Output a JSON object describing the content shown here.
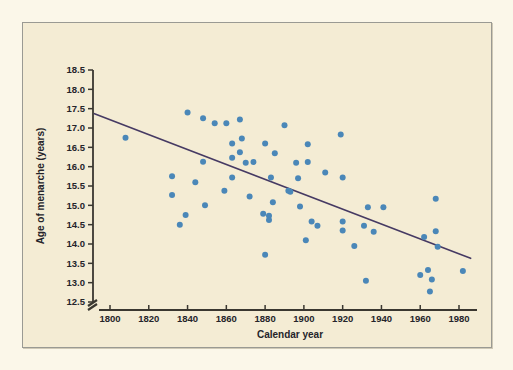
{
  "figure": {
    "background_color": "#f4ecd4",
    "page_color": "#fbf7e9",
    "frame_color": "#9a9a93"
  },
  "chart_data": {
    "type": "scatter",
    "title": "",
    "xlabel": "Calendar year",
    "ylabel": "Age of menarche (years)",
    "xlim": [
      1785,
      1990
    ],
    "ylim": [
      12.5,
      18.5
    ],
    "x_ticks": [
      1800,
      1820,
      1840,
      1860,
      1880,
      1900,
      1920,
      1940,
      1960,
      1980
    ],
    "y_ticks": [
      12.5,
      13.0,
      13.5,
      14.0,
      14.5,
      15.0,
      15.5,
      16.0,
      16.5,
      17.0,
      17.5,
      18.0,
      18.5
    ],
    "x_tick_labels": [
      "1800",
      "1820",
      "1840",
      "1860",
      "1880",
      "1900",
      "1920",
      "1940",
      "1960",
      "1980"
    ],
    "y_tick_labels": [
      "12.5",
      "13.0",
      "13.5",
      "14.0",
      "14.5",
      "15.0",
      "15.5",
      "16.0",
      "16.5",
      "17.0",
      "17.5",
      "18.0",
      "18.5"
    ],
    "grid": false,
    "legend": null,
    "axis_break_y": true,
    "point_color": "#4a87b8",
    "point_radius": 3.0,
    "trendline": {
      "color": "#463a63",
      "width": 1.6,
      "x_start": 1792,
      "y_start": 17.37,
      "x_end": 1986,
      "y_end": 13.63
    },
    "points": [
      {
        "x": 1808,
        "y": 16.75
      },
      {
        "x": 1832,
        "y": 15.75
      },
      {
        "x": 1832,
        "y": 15.27
      },
      {
        "x": 1836,
        "y": 14.5
      },
      {
        "x": 1839,
        "y": 14.75
      },
      {
        "x": 1840,
        "y": 17.4
      },
      {
        "x": 1844,
        "y": 15.6
      },
      {
        "x": 1848,
        "y": 17.25
      },
      {
        "x": 1848,
        "y": 16.13
      },
      {
        "x": 1849,
        "y": 15.0
      },
      {
        "x": 1854,
        "y": 17.12
      },
      {
        "x": 1859,
        "y": 15.38
      },
      {
        "x": 1860,
        "y": 17.12
      },
      {
        "x": 1863,
        "y": 16.6
      },
      {
        "x": 1863,
        "y": 16.23
      },
      {
        "x": 1863,
        "y": 15.72
      },
      {
        "x": 1867,
        "y": 17.22
      },
      {
        "x": 1867,
        "y": 16.37
      },
      {
        "x": 1868,
        "y": 16.73
      },
      {
        "x": 1870,
        "y": 16.1
      },
      {
        "x": 1872,
        "y": 15.23
      },
      {
        "x": 1874,
        "y": 16.12
      },
      {
        "x": 1879,
        "y": 14.78
      },
      {
        "x": 1880,
        "y": 16.6
      },
      {
        "x": 1880,
        "y": 13.72
      },
      {
        "x": 1882,
        "y": 14.73
      },
      {
        "x": 1882,
        "y": 14.62
      },
      {
        "x": 1883,
        "y": 15.72
      },
      {
        "x": 1884,
        "y": 15.08
      },
      {
        "x": 1885,
        "y": 16.35
      },
      {
        "x": 1890,
        "y": 17.07
      },
      {
        "x": 1892,
        "y": 15.38
      },
      {
        "x": 1893,
        "y": 15.35
      },
      {
        "x": 1896,
        "y": 16.1
      },
      {
        "x": 1897,
        "y": 15.7
      },
      {
        "x": 1898,
        "y": 14.97
      },
      {
        "x": 1901,
        "y": 14.1
      },
      {
        "x": 1902,
        "y": 16.58
      },
      {
        "x": 1902,
        "y": 16.12
      },
      {
        "x": 1904,
        "y": 14.58
      },
      {
        "x": 1907,
        "y": 14.47
      },
      {
        "x": 1911,
        "y": 15.85
      },
      {
        "x": 1919,
        "y": 16.83
      },
      {
        "x": 1920,
        "y": 15.72
      },
      {
        "x": 1920,
        "y": 14.58
      },
      {
        "x": 1920,
        "y": 14.35
      },
      {
        "x": 1926,
        "y": 13.95
      },
      {
        "x": 1931,
        "y": 14.47
      },
      {
        "x": 1932,
        "y": 13.05
      },
      {
        "x": 1933,
        "y": 14.95
      },
      {
        "x": 1936,
        "y": 14.32
      },
      {
        "x": 1941,
        "y": 14.95
      },
      {
        "x": 1960,
        "y": 13.2
      },
      {
        "x": 1962,
        "y": 14.18
      },
      {
        "x": 1964,
        "y": 13.33
      },
      {
        "x": 1965,
        "y": 12.77
      },
      {
        "x": 1966,
        "y": 13.08
      },
      {
        "x": 1968,
        "y": 15.17
      },
      {
        "x": 1968,
        "y": 14.33
      },
      {
        "x": 1969,
        "y": 13.93
      },
      {
        "x": 1982,
        "y": 13.3
      }
    ]
  }
}
